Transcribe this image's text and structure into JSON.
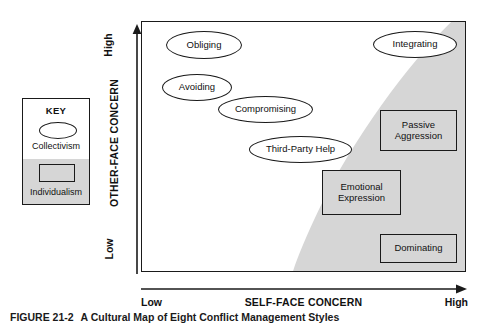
{
  "figure": {
    "caption_number": "FIGURE 21-2",
    "caption_text": "A Cultural Map of Eight Conflict Management Styles"
  },
  "key": {
    "title": "KEY",
    "ellipse_label": "Collectivism",
    "rect_label": "Individualism",
    "ellipse_icon": "ellipse-outline-icon",
    "rect_icon": "rectangle-shaded-icon"
  },
  "axes": {
    "y": {
      "title": "OTHER-FACE CONCERN",
      "low": "Low",
      "high": "High",
      "arrow_icon": "up-arrow-icon"
    },
    "x": {
      "title": "SELF-FACE CONCERN",
      "low": "Low",
      "high": "High",
      "arrow_icon": "right-arrow-icon"
    }
  },
  "colors": {
    "individualism_fill": "#d6d6d6",
    "collectivism_fill": "#ffffff",
    "outline": "#1a1a1a"
  },
  "chart_data": {
    "type": "scatter",
    "title": "A Cultural Map of Eight Conflict Management Styles",
    "xlabel": "SELF-FACE CONCERN",
    "ylabel": "OTHER-FACE CONCERN",
    "xlim": [
      0,
      100
    ],
    "ylim": [
      0,
      100
    ],
    "xtick_labels": [
      "Low",
      "High"
    ],
    "ytick_labels": [
      "Low",
      "High"
    ],
    "grid": false,
    "legend": {
      "position": "left-outside",
      "title": "KEY",
      "entries": [
        {
          "label": "Collectivism",
          "shape": "ellipse",
          "fill": "#ffffff"
        },
        {
          "label": "Individualism",
          "shape": "rectangle",
          "fill": "#d6d6d6"
        }
      ]
    },
    "regions": [
      {
        "name": "Individualism",
        "fill": "#d6d6d6",
        "shape": "circular-arc",
        "description": "Shaded region occupying the lower-right of the plot, bounded by a concave arc running from the top edge near high self-face concern down to the bottom edge at mid self-face concern."
      },
      {
        "name": "Collectivism",
        "fill": "#ffffff",
        "description": "Unshaded region occupying the upper-left of the plot."
      }
    ],
    "points": [
      {
        "label": "Obliging",
        "x": 16,
        "y": 92,
        "shape": "ellipse",
        "group": "Collectivism"
      },
      {
        "label": "Avoiding",
        "x": 14,
        "y": 72,
        "shape": "ellipse",
        "group": "Collectivism"
      },
      {
        "label": "Compromising",
        "x": 32,
        "y": 60,
        "shape": "ellipse",
        "group": "Collectivism"
      },
      {
        "label": "Third-Party Help",
        "x": 42,
        "y": 44,
        "shape": "ellipse",
        "group": "Collectivism"
      },
      {
        "label": "Integrating",
        "x": 86,
        "y": 92,
        "shape": "ellipse",
        "group": "Collectivism"
      },
      {
        "label": "Passive Aggression",
        "x": 84,
        "y": 46,
        "shape": "rectangle",
        "group": "Individualism"
      },
      {
        "label": "Emotional Expression",
        "x": 62,
        "y": 23,
        "shape": "rectangle",
        "group": "Individualism"
      },
      {
        "label": "Dominating",
        "x": 86,
        "y": 6,
        "shape": "rectangle",
        "group": "Individualism"
      }
    ]
  },
  "nodes": [
    {
      "label": "Obliging",
      "left": 24,
      "top": 9,
      "width": 76,
      "height": 28,
      "shape": "ellipse"
    },
    {
      "label": "Avoiding",
      "left": 20,
      "top": 52,
      "width": 70,
      "height": 27,
      "shape": "ellipse"
    },
    {
      "label": "Compromising",
      "left": 76,
      "top": 74,
      "width": 95,
      "height": 27,
      "shape": "ellipse"
    },
    {
      "label": "Third-Party Help",
      "left": 107,
      "top": 114,
      "width": 103,
      "height": 27,
      "shape": "ellipse"
    },
    {
      "label": "Integrating",
      "left": 231,
      "top": 9,
      "width": 84,
      "height": 27,
      "shape": "ellipse"
    },
    {
      "label": "Passive Aggression",
      "left": 238,
      "top": 88,
      "width": 77,
      "height": 41,
      "shape": "rectangle"
    },
    {
      "label": "Emotional Expression",
      "left": 180,
      "top": 148,
      "width": 79,
      "height": 45,
      "shape": "rectangle"
    },
    {
      "label": "Dominating",
      "left": 238,
      "top": 212,
      "width": 77,
      "height": 29,
      "shape": "rectangle"
    }
  ]
}
